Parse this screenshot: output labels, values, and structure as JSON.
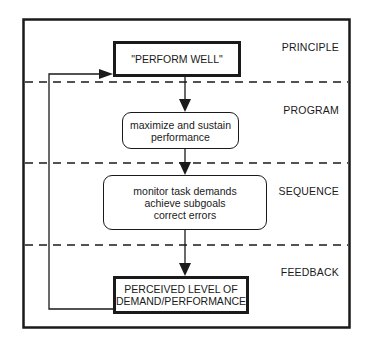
{
  "diagram": {
    "type": "hierarchical-control-flow",
    "levels": [
      {
        "id": "principle",
        "label": "PRINCIPLE"
      },
      {
        "id": "program",
        "label": "PROGRAM"
      },
      {
        "id": "sequence",
        "label": "SEQUENCE"
      },
      {
        "id": "feedback",
        "label": "FEEDBACK"
      }
    ],
    "nodes": {
      "perform_well": {
        "lines": [
          "\"PERFORM WELL\""
        ],
        "shape": "rectangle-bold"
      },
      "maximize": {
        "lines": [
          "maximize and sustain",
          "performance"
        ],
        "shape": "rounded"
      },
      "monitor": {
        "lines": [
          "monitor task demands",
          "achieve subgoals",
          "correct errors"
        ],
        "shape": "rounded"
      },
      "perceived": {
        "lines": [
          "PERCEIVED LEVEL OF",
          "DEMAND/PERFORMANCE"
        ],
        "shape": "rectangle-bold"
      }
    },
    "edges": [
      {
        "from": "perform_well",
        "to": "maximize",
        "type": "arrow-down"
      },
      {
        "from": "maximize",
        "to": "monitor",
        "type": "arrow-down"
      },
      {
        "from": "monitor",
        "to": "perceived",
        "type": "arrow-down"
      },
      {
        "from": "perceived",
        "to": "perform_well",
        "type": "feedback-loop-left"
      }
    ],
    "colors": {
      "stroke": "#1a1a1a",
      "background": "#ffffff"
    }
  }
}
